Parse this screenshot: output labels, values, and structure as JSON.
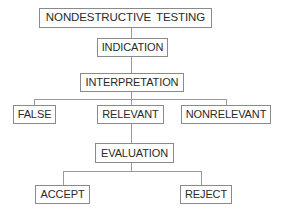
{
  "diagram": {
    "type": "flowchart-tree",
    "nodes": {
      "root": {
        "label": "NONDESTRUCTIVE TESTING"
      },
      "indication": {
        "label": "INDICATION"
      },
      "interpretation": {
        "label": "INTERPRETATION"
      },
      "false": {
        "label": "FALSE"
      },
      "relevant": {
        "label": "RELEVANT"
      },
      "nonrelevant": {
        "label": "NONRELEVANT"
      },
      "evaluation": {
        "label": "EVALUATION"
      },
      "accept": {
        "label": "ACCEPT"
      },
      "reject": {
        "label": "REJECT"
      }
    },
    "edges": [
      [
        "NONDESTRUCTIVE TESTING",
        "INDICATION"
      ],
      [
        "INDICATION",
        "INTERPRETATION"
      ],
      [
        "INTERPRETATION",
        "FALSE"
      ],
      [
        "INTERPRETATION",
        "RELEVANT"
      ],
      [
        "INTERPRETATION",
        "NONRELEVANT"
      ],
      [
        "RELEVANT",
        "EVALUATION"
      ],
      [
        "EVALUATION",
        "ACCEPT"
      ],
      [
        "EVALUATION",
        "REJECT"
      ]
    ],
    "colors": {
      "box_border": "#8a8a8a",
      "connector": "#9a9a9a",
      "text": "#2a2a2a",
      "background": "#ffffff"
    }
  }
}
